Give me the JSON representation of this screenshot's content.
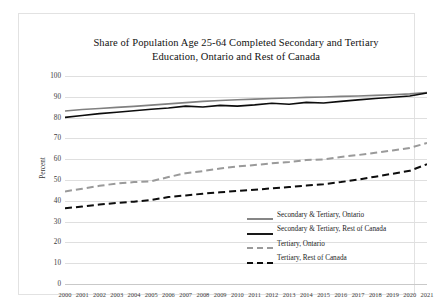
{
  "chart_data": {
    "type": "line",
    "title": "Share of Population Age 25-64 Completed Secondary and Tertiary Education, Ontario and Rest of Canada",
    "title_lines": [
      "Share of Population Age 25-64 Completed Secondary and Tertiary",
      "Education, Ontario and Rest of Canada"
    ],
    "xlabel": "",
    "ylabel": "Percent",
    "ylim": [
      0,
      100
    ],
    "ytick_step": 10,
    "grid": true,
    "legend_position": "inside-right-middle",
    "ytick_labels": [
      "100",
      "90",
      "80",
      "70",
      "60",
      "50",
      "40",
      "30",
      "20",
      "10",
      "0"
    ],
    "ytick_values": [
      100,
      90,
      80,
      70,
      60,
      50,
      40,
      30,
      20,
      10,
      0
    ],
    "categories": [
      "2000",
      "2001",
      "2002",
      "2003",
      "2004",
      "2005",
      "2006",
      "2007",
      "2008",
      "2009",
      "2010",
      "2011",
      "2012",
      "2013",
      "2014",
      "2015",
      "2016",
      "2017",
      "2018",
      "2019",
      "2020",
      "2021"
    ],
    "x": [
      2000,
      2001,
      2002,
      2003,
      2004,
      2005,
      2006,
      2007,
      2008,
      2009,
      2010,
      2011,
      2012,
      2013,
      2014,
      2015,
      2016,
      2017,
      2018,
      2019,
      2020,
      2021
    ],
    "series": [
      {
        "name": "Secondary & Tertiary, Ontario",
        "color": "#808080",
        "style": "solid",
        "width": 1.6,
        "values": [
          83.2,
          83.9,
          84.4,
          84.9,
          85.4,
          86.0,
          86.6,
          87.2,
          87.8,
          88.2,
          88.6,
          88.9,
          89.2,
          89.4,
          89.7,
          89.9,
          90.2,
          90.4,
          90.7,
          91.0,
          91.4,
          92.0
        ]
      },
      {
        "name": "Secondary & Tertiary, Rest of Canada",
        "color": "#0d0d0d",
        "style": "solid",
        "width": 1.6,
        "values": [
          80.1,
          81.0,
          81.9,
          82.6,
          83.3,
          84.0,
          84.6,
          85.5,
          85.1,
          85.9,
          85.5,
          86.1,
          86.9,
          86.4,
          87.3,
          87.0,
          87.8,
          88.5,
          89.2,
          89.8,
          90.4,
          91.8
        ]
      },
      {
        "name": "Tertiary, Ontario",
        "color": "#9a9a9a",
        "style": "dashed",
        "width": 2.0,
        "values": [
          44.5,
          45.8,
          47.2,
          48.3,
          49.0,
          49.4,
          51.4,
          53.3,
          54.3,
          55.5,
          56.5,
          57.2,
          58.0,
          58.6,
          59.6,
          59.9,
          61.1,
          62.0,
          63.1,
          64.2,
          65.4,
          67.8
        ]
      },
      {
        "name": "Tertiary, Rest of Canada",
        "color": "#0d0d0d",
        "style": "dashed",
        "width": 2.0,
        "values": [
          36.4,
          37.2,
          38.2,
          39.0,
          39.6,
          40.4,
          41.8,
          42.6,
          43.4,
          44.1,
          44.7,
          45.3,
          46.0,
          46.6,
          47.3,
          48.0,
          49.0,
          50.2,
          51.6,
          53.0,
          54.4,
          57.6
        ]
      }
    ],
    "legend": [
      {
        "label": "Secondary & Tertiary, Ontario",
        "color": "#808080",
        "style": "solid"
      },
      {
        "label": "Secondary & Tertiary, Rest of Canada",
        "color": "#0d0d0d",
        "style": "solid"
      },
      {
        "label": "Tertiary, Ontario",
        "color": "#9a9a9a",
        "style": "dashed"
      },
      {
        "label": "Tertiary, Rest of Canada",
        "color": "#0d0d0d",
        "style": "dashed"
      }
    ]
  }
}
